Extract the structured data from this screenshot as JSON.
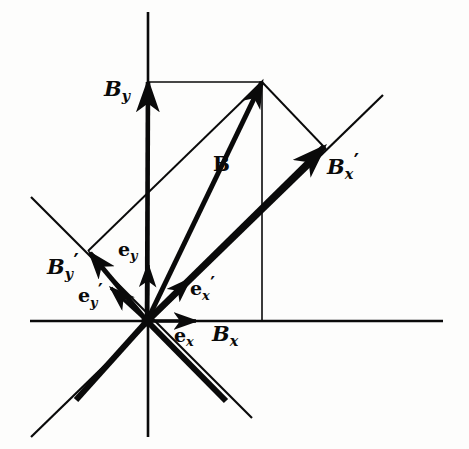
{
  "figure": {
    "background_color": "#fdfdfc",
    "ink_color": "#0a0a0a",
    "width": 469,
    "height": 449
  },
  "geometry": {
    "origin": {
      "x": 147,
      "y": 321
    },
    "axes": {
      "x_axis": {
        "x1": 30,
        "y1": 321,
        "x2": 443,
        "y2": 321,
        "stroke_width": 2.6
      },
      "y_axis": {
        "x1": 148,
        "y1": 12,
        "x2": 148,
        "y2": 437,
        "stroke_width": 2.6
      },
      "x_prime_axis": {
        "x1": 31,
        "y1": 437,
        "x2": 383,
        "y2": 95,
        "stroke_width": 2.2
      },
      "y_prime_axis": {
        "x1": 31,
        "y1": 197,
        "x2": 252,
        "y2": 418,
        "stroke_width": 2.2
      }
    },
    "vectors": {
      "B": {
        "x1": 147,
        "y1": 321,
        "x2": 262,
        "y2": 82,
        "stroke_width": 5.0
      },
      "B_y": {
        "x1": 147,
        "y1": 321,
        "x2": 148,
        "y2": 82,
        "stroke_width": 4.6
      },
      "B_x_prime": {
        "x1": 147,
        "y1": 321,
        "x2": 324,
        "y2": 147,
        "stroke_width": 6.0
      },
      "B_y_prime": {
        "x1": 147,
        "y1": 321,
        "x2": 90,
        "y2": 253,
        "stroke_width": 5.0
      },
      "e_x": {
        "x1": 147,
        "y1": 321,
        "x2": 196,
        "y2": 321,
        "stroke_width": 3.4
      },
      "e_y": {
        "x1": 147,
        "y1": 321,
        "x2": 148,
        "y2": 265,
        "stroke_width": 3.4
      },
      "e_x_prime": {
        "x1": 147,
        "y1": 321,
        "x2": 190,
        "y2": 279,
        "stroke_width": 3.6
      },
      "e_y_prime": {
        "x1": 147,
        "y1": 321,
        "x2": 111,
        "y2": 288,
        "stroke_width": 3.6
      }
    },
    "construction_lines": [
      {
        "name": "top-horizontal-from-By-tip",
        "x1": 148,
        "y1": 82,
        "x2": 262,
        "y2": 82,
        "stroke_width": 1.6
      },
      {
        "name": "vertical-drop-from-B-tip",
        "x1": 262,
        "y1": 82,
        "x2": 262,
        "y2": 321,
        "stroke_width": 1.6
      },
      {
        "name": "B-tip-to-Bxprime-tip",
        "x1": 262,
        "y1": 82,
        "x2": 326,
        "y2": 149,
        "stroke_width": 1.9
      },
      {
        "name": "Byprime-tip-to-B-tip",
        "x1": 88,
        "y1": 251,
        "x2": 262,
        "y2": 82,
        "stroke_width": 1.9
      }
    ],
    "thick_primed_rays": [
      {
        "name": "x-prime-lower-left-ray",
        "x1": 147,
        "y1": 321,
        "x2": 76,
        "y2": 400,
        "stroke_width": 6.0
      },
      {
        "name": "y-prime-lower-right-ray",
        "x1": 147,
        "y1": 321,
        "x2": 226,
        "y2": 401,
        "stroke_width": 6.0
      }
    ]
  },
  "labels": {
    "B_y": {
      "base": "B",
      "sub": "y",
      "prime": "",
      "x": 104,
      "y": 78,
      "name": "label-B-y"
    },
    "B": {
      "base": "B",
      "sub": "",
      "prime": "",
      "x": 213,
      "y": 154,
      "name": "label-B"
    },
    "B_x_prime": {
      "base": "B",
      "sub": "x",
      "prime": "′",
      "x": 327,
      "y": 152,
      "name": "label-B-x-prime"
    },
    "B_y_prime": {
      "base": "B",
      "sub": "y",
      "prime": "′",
      "x": 47,
      "y": 252,
      "name": "label-B-y-prime"
    },
    "e_y": {
      "base": "e",
      "sub": "y",
      "prime": "",
      "x": 118,
      "y": 240,
      "name": "label-e-y"
    },
    "e_y_prime": {
      "base": "e",
      "sub": "y",
      "prime": "′",
      "x": 78,
      "y": 282,
      "name": "label-e-y-prime"
    },
    "e_x_prime": {
      "base": "e",
      "sub": "x",
      "prime": "′",
      "x": 190,
      "y": 275,
      "name": "label-e-x-prime"
    },
    "e_x": {
      "base": "e",
      "sub": "x",
      "prime": "",
      "x": 174,
      "y": 326,
      "name": "label-e-x"
    },
    "B_x": {
      "base": "B",
      "sub": "x",
      "prime": "",
      "x": 212,
      "y": 323,
      "name": "label-B-x"
    }
  }
}
